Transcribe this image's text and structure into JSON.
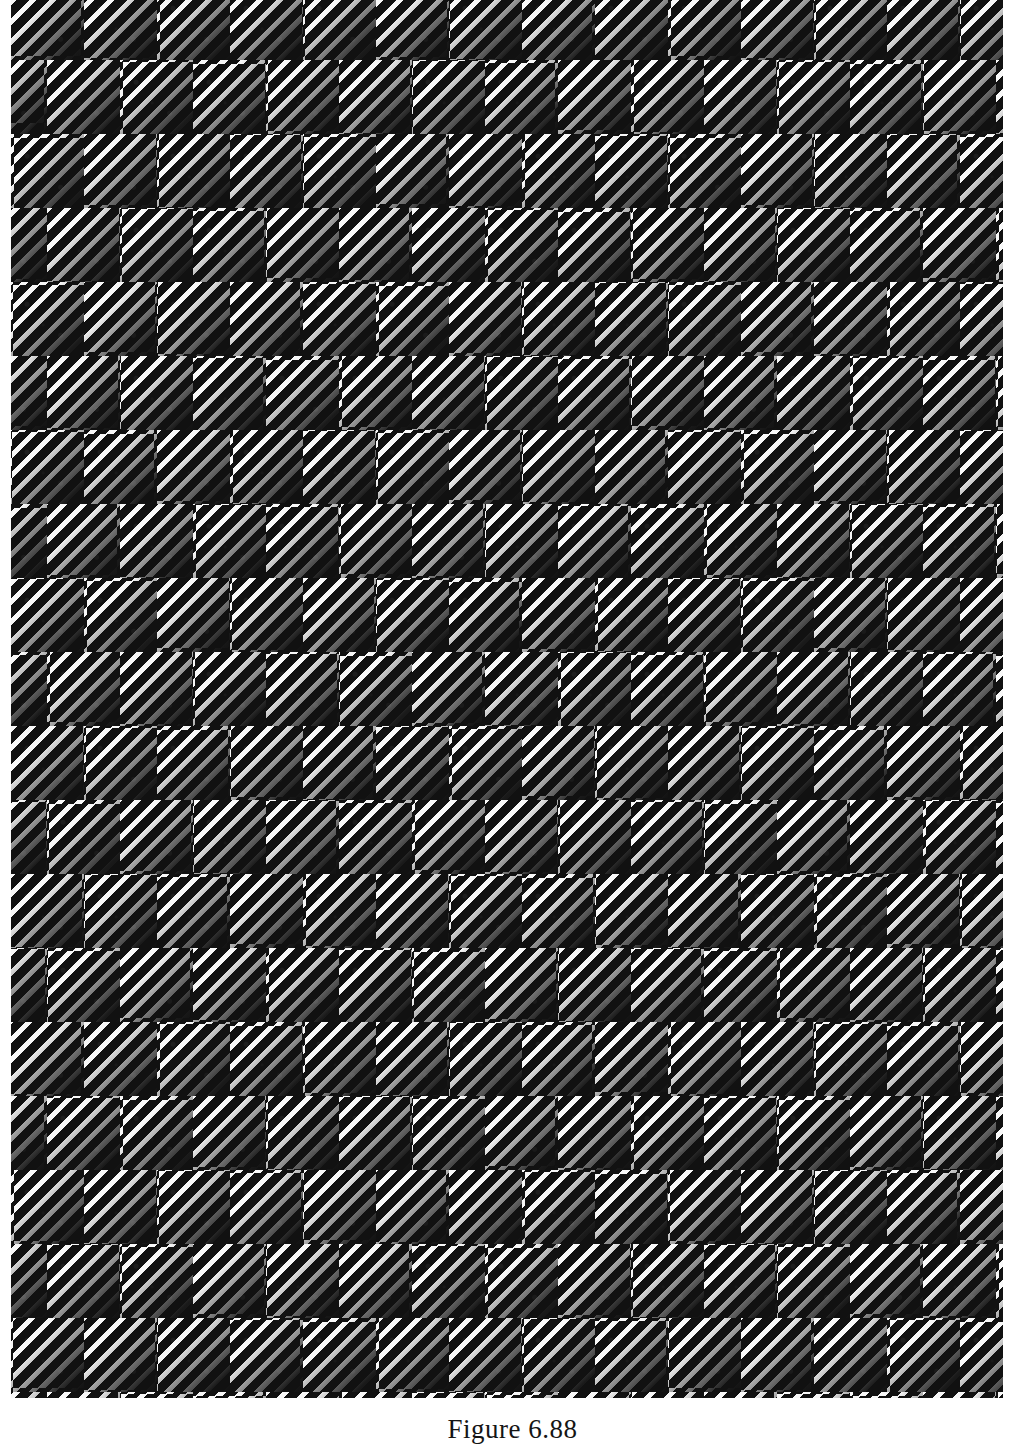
{
  "page": {
    "width": 1025,
    "height": 1454,
    "background_color": "#ffffff",
    "kind": "book-plate"
  },
  "figure": {
    "name": "diagonal-ruled-checkerboard-plate",
    "ink_color": "#111111",
    "paper_color": "#ffffff",
    "stripe_color": "#ffffff",
    "cell_size_px": 73,
    "cell_height_px": 74,
    "row_offset_px": 36,
    "stripe_spacing_px": 14,
    "stripe_width_px": 5,
    "stripe_angle_deg": 135,
    "plate": {
      "left": 11,
      "top": -14,
      "width": 992,
      "height": 1412
    },
    "columns": 14,
    "rows": 20
  },
  "caption": {
    "text": "Figure 6.88",
    "label": "Figure",
    "number": "6.88",
    "clipped_at_page_bottom": true
  }
}
